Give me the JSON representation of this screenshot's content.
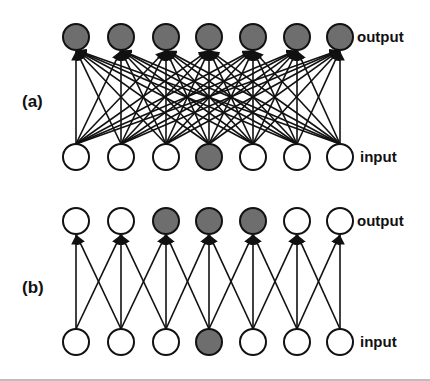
{
  "panels": [
    {
      "id": "a",
      "label": "(a)",
      "output_label": "output",
      "input_label": "input",
      "output_y": 37,
      "input_y": 157,
      "label_y": 101,
      "connectivity": "full",
      "output_nodes_shaded": [
        true,
        true,
        true,
        true,
        true,
        true,
        true
      ],
      "input_nodes_shaded": [
        false,
        false,
        false,
        true,
        false,
        false,
        false
      ]
    },
    {
      "id": "b",
      "label": "(b)",
      "output_label": "output",
      "input_label": "input",
      "output_y": 221,
      "input_y": 342,
      "label_y": 287,
      "connectivity": "local-3",
      "output_nodes_shaded": [
        false,
        false,
        true,
        true,
        true,
        false,
        false
      ],
      "input_nodes_shaded": [
        false,
        false,
        false,
        true,
        false,
        false,
        false
      ]
    }
  ],
  "node_x": [
    76,
    121,
    166,
    209,
    253,
    297,
    340
  ],
  "node_radius": 13,
  "colors": {
    "shaded_fill": "#6e6e6e",
    "empty_fill": "#ffffff",
    "stroke": "#111111"
  }
}
